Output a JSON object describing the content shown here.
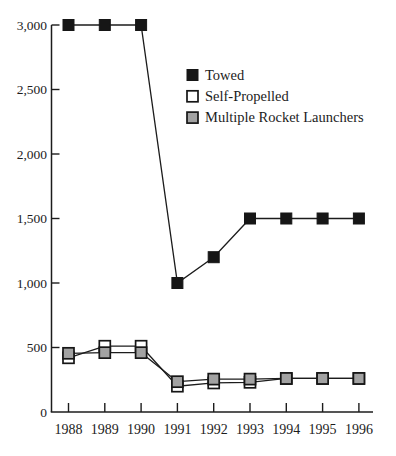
{
  "chart_data": {
    "type": "line",
    "x_labels": [
      "1988",
      "1989",
      "1990",
      "1991",
      "1992",
      "1993",
      "1994",
      "1995",
      "1996"
    ],
    "series": [
      {
        "name": "Towed",
        "marker": "filled-square",
        "values": [
          3000,
          3000,
          3000,
          1000,
          1200,
          1500,
          1500,
          1500,
          1500
        ]
      },
      {
        "name": "Self-Propelled",
        "marker": "open-square",
        "values": [
          420,
          510,
          510,
          200,
          225,
          230,
          260,
          260,
          260
        ]
      },
      {
        "name": "Multiple Rocket Launchers",
        "marker": "gray-square",
        "values": [
          455,
          460,
          460,
          235,
          255,
          255,
          260,
          260,
          260
        ]
      }
    ],
    "ylim": [
      0,
      3000
    ],
    "yticks": [
      0,
      500,
      1000,
      1500,
      2000,
      2500,
      3000
    ],
    "ytick_labels": [
      "0",
      "500",
      "1,000",
      "1,500",
      "2,000",
      "2,500",
      "3,000"
    ],
    "grid": false,
    "legend_position": "upper-center",
    "colors": {
      "ink": "#1c1c1c",
      "filled_square": "#161616",
      "open_square_fill": "#ffffff",
      "gray_square_fill": "#a2a2a2",
      "marker_border": "#161616",
      "background": "#ffffff"
    }
  }
}
